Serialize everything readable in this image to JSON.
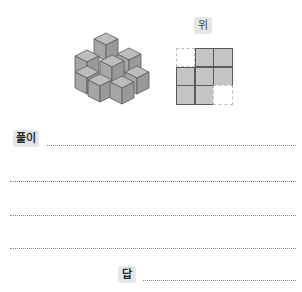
{
  "figure": {
    "name": "stacked-cubes",
    "top_view_label": "위",
    "top_view_grid": [
      [
        0,
        1,
        1
      ],
      [
        1,
        1,
        1
      ],
      [
        1,
        1,
        0
      ]
    ]
  },
  "solution": {
    "label": "풀이",
    "line_count": 4
  },
  "answer": {
    "label": "답"
  },
  "colors": {
    "cube_face_light": "#bdbdbd",
    "cube_face_mid": "#a8a8a8",
    "cube_face_dark": "#969696",
    "cube_edge": "#5a5a5a",
    "badge_bg": "#e6e6e6",
    "grid_fill": "#c4c4c4"
  }
}
